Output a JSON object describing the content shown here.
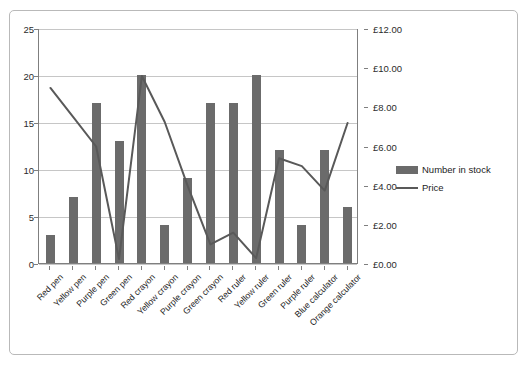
{
  "chart_data": {
    "type": "bar",
    "title": "",
    "subtitle": "",
    "xlabel": "",
    "ylabel": "",
    "y2label": "",
    "grid": true,
    "legend_position": "right",
    "categories": [
      "Red pen",
      "Yellow pen",
      "Purple pen",
      "Green pen",
      "Red crayon",
      "Yellow crayon",
      "Purple crayon",
      "Green crayon",
      "Red ruler",
      "Yellow ruler",
      "Green ruler",
      "Purple ruler",
      "Blue calculator",
      "Orange calculator"
    ],
    "series": [
      {
        "name": "Number in stock",
        "type": "bar",
        "axis": "left",
        "color": "#6b6b6b",
        "values": [
          3,
          7,
          17,
          13,
          20,
          4,
          9,
          17,
          17,
          20,
          12,
          4,
          12,
          6
        ]
      },
      {
        "name": "Price",
        "type": "line",
        "axis": "right",
        "color": "#595959",
        "values": [
          8.99,
          7.5,
          6.0,
          0.25,
          9.6,
          7.25,
          4.0,
          1.0,
          1.6,
          0.3,
          5.4,
          5.0,
          3.75,
          7.2
        ]
      }
    ],
    "ylim": [
      0,
      25
    ],
    "ytick_step": 5,
    "yticks": [
      "0",
      "5",
      "10",
      "15",
      "20",
      "25"
    ],
    "y2lim": [
      0,
      12
    ],
    "y2tick_step": 2,
    "y2ticks": [
      "£0.00",
      "£2.00",
      "£4.00",
      "£6.00",
      "£8.00",
      "£10.00",
      "£12.00"
    ]
  },
  "legend": {
    "items": [
      {
        "label": "Number in stock",
        "marker": "bar-swatch"
      },
      {
        "label": "Price",
        "marker": "line-swatch"
      }
    ]
  },
  "colors": {
    "bar": "#6b6b6b",
    "line": "#595959",
    "grid": "#c6c6c6",
    "axis": "#7f7f7f",
    "frame": "#b9b9b9",
    "text": "#1d1d1d",
    "background": "#ffffff"
  }
}
